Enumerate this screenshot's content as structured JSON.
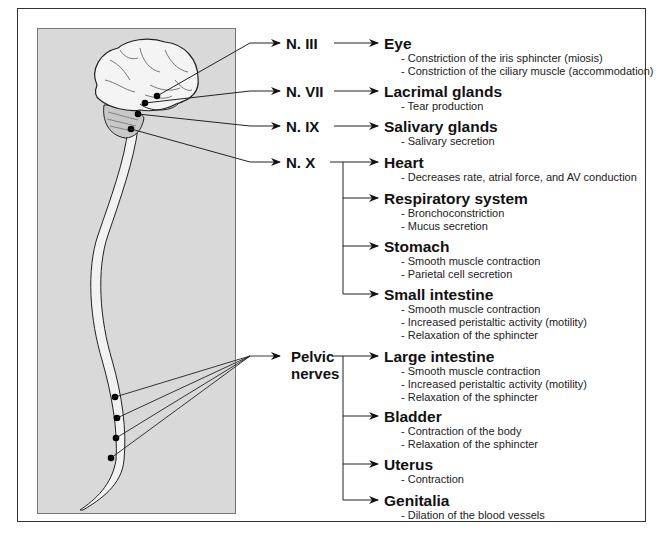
{
  "diagram": {
    "type": "parasympathetic-nervous-system-innervation",
    "nerves": [
      {
        "id": "n3",
        "label": "N. III"
      },
      {
        "id": "n7",
        "label": "N. VII"
      },
      {
        "id": "n9",
        "label": "N. IX"
      },
      {
        "id": "n10",
        "label": "N. X"
      },
      {
        "id": "pelvic",
        "label_line1": "Pelvic",
        "label_line2": "nerves"
      }
    ],
    "organs": [
      {
        "title": "Eye",
        "nerve": "N. III",
        "effects": [
          "- Constriction of the iris sphincter (miosis)",
          "- Constriction of the ciliary muscle (accommodation)"
        ]
      },
      {
        "title": "Lacrimal glands",
        "nerve": "N. VII",
        "effects": [
          "- Tear production"
        ]
      },
      {
        "title": "Salivary glands",
        "nerve": "N. IX",
        "effects": [
          "- Salivary secretion"
        ]
      },
      {
        "title": "Heart",
        "nerve": "N. X",
        "effects": [
          "- Decreases rate, atrial force, and AV conduction"
        ]
      },
      {
        "title": "Respiratory system",
        "nerve": "N. X",
        "effects": [
          "- Bronchoconstriction",
          "- Mucus secretion"
        ]
      },
      {
        "title": "Stomach",
        "nerve": "N. X",
        "effects": [
          "- Smooth muscle contraction",
          "- Parietal cell secretion"
        ]
      },
      {
        "title": "Small intestine",
        "nerve": "N. X",
        "effects": [
          "- Smooth muscle contraction",
          "- Increased peristaltic activity (motility)",
          "- Relaxation of the sphincter"
        ]
      },
      {
        "title": "Large intestine",
        "nerve": "Pelvic nerves",
        "effects": [
          "- Smooth muscle contraction",
          "- Increased peristaltic activity (motility)",
          "- Relaxation of the sphincter"
        ]
      },
      {
        "title": "Bladder",
        "nerve": "Pelvic nerves",
        "effects": [
          "- Contraction of the body",
          "- Relaxation of the sphincter"
        ]
      },
      {
        "title": "Uterus",
        "nerve": "Pelvic nerves",
        "effects": [
          "- Contraction"
        ]
      },
      {
        "title": "Genitalia",
        "nerve": "Pelvic nerves",
        "effects": [
          "- Dilation of the blood vessels"
        ]
      }
    ],
    "colors": {
      "panel": "#d9d9d9",
      "line": "#222222",
      "frame": "#333333"
    }
  }
}
